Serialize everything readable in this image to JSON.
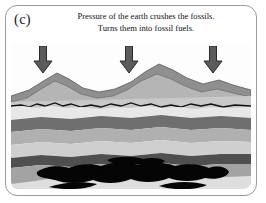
{
  "figure": {
    "panel_letter": "(c)",
    "caption": {
      "line_1": "Pressure of the earth crushes the fossils.",
      "line_2": "Turns them into fossil fuels."
    }
  },
  "arrows": {
    "label": "pressure-arrow",
    "count": 3,
    "direction": "down",
    "color": "#5c5c5c",
    "outline": "#2b2b2b",
    "positions": [
      {
        "name": "pressure-arrow-left",
        "x": 22,
        "y": 2
      },
      {
        "name": "pressure-arrow-center",
        "x": 108,
        "y": 2
      },
      {
        "name": "pressure-arrow-right",
        "x": 192,
        "y": 2
      }
    ]
  },
  "scene": {
    "sky_color": "#fdfdfd",
    "mountain_far_color": "#8f8f8f",
    "mountain_near_color": "#b5b5b5",
    "mountain_outline": "#5a5a5a",
    "ground_line_color": "#111111",
    "layers": [
      {
        "name": "soil-layer",
        "color": "#c9c9c9"
      },
      {
        "name": "pale-sediment-layer",
        "color": "#e3e3e3"
      },
      {
        "name": "dark-rock-layer",
        "color": "#6f6f6f"
      },
      {
        "name": "mid-gray-layer",
        "color": "#b0b0b0"
      },
      {
        "name": "light-gray-layer",
        "color": "#cfcfcf"
      },
      {
        "name": "dark-band-layer",
        "color": "#555555"
      },
      {
        "name": "deep-gray-layer",
        "color": "#a3a3a3"
      },
      {
        "name": "bottom-pale-layer",
        "color": "#dddddd"
      }
    ],
    "fossil_fuel_deposit": {
      "name": "fossil-fuel-deposit",
      "color": "#050505",
      "description": "black irregular oil and coal pockets"
    }
  },
  "frame": {
    "border_color": "#9a9a9a",
    "corner_radius_px": 12
  }
}
